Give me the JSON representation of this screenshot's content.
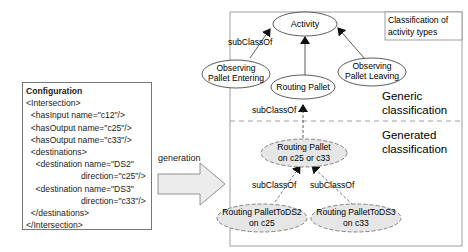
{
  "configuration": {
    "title": "Configuration",
    "lines": [
      "<Intersection>",
      "  <hasInput name=\"c12\"/>",
      "  <hasOutput name=\"c25\"/>",
      "  <hasOutput name=\"c33\"/>",
      "  <destinations>",
      "    <destination name=\"DS2\"",
      "                       direction=\"c25\"/>",
      "    <destination name=\"DS3\"",
      "                       direction=\"c33\"/>",
      "  </destinations>",
      "</Intersection>"
    ]
  },
  "arrow_label": "generation",
  "panel": {
    "title_line1": "Classification of",
    "title_line2": "activity types",
    "generic_line1": "Generic",
    "generic_line2": "classification",
    "generated_line1": "Generated",
    "generated_line2": "classification"
  },
  "nodes": {
    "activity": "Activity",
    "obs_entering_1": "Observing",
    "obs_entering_2": "Pallet Entering",
    "obs_leaving_1": "Observing",
    "obs_leaving_2": "Pallet Leaving",
    "routing_pallet": "Routing Pallet",
    "routing_c25_c33_1": "Routing Pallet",
    "routing_c25_c33_2": "on c25 or c33",
    "routing_ds2_1": "Routing PalletToDS2",
    "routing_ds2_2": "on c25",
    "routing_ds3_1": "Routing PalletToDS3",
    "routing_ds3_2": "on c33"
  },
  "edge_labels": {
    "sub1": "subClassOf",
    "sub2": "subClassOf",
    "sub3": "subClassOf",
    "sub4": "subClassOf"
  }
}
